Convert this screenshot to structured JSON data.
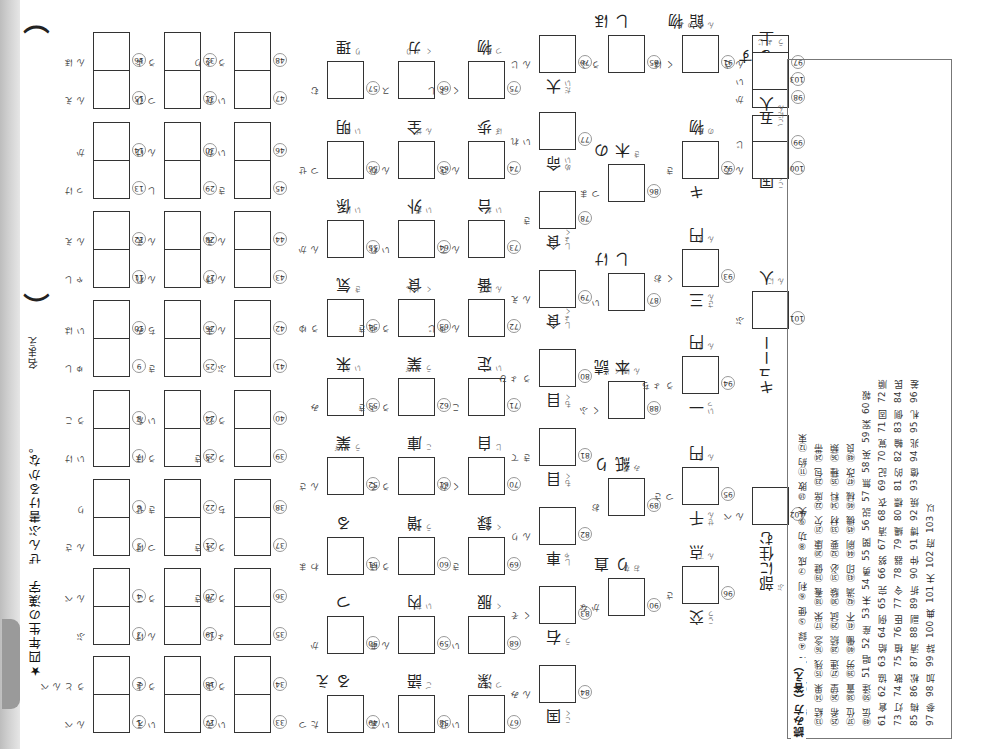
{
  "worksheet": {
    "title": "★四年生の漢字　ぜんぶ書けるかな。",
    "name_label": "名まえ",
    "name_paren_open": "（",
    "name_paren_close": "）",
    "orientation": "rotated 180°"
  },
  "pair_questions": [
    {
      "n": "1",
      "furi": "べん"
    },
    {
      "n": "2",
      "furi": "べんとう"
    },
    {
      "n": "3",
      "furi": "ぶ"
    },
    {
      "n": "4",
      "furi": "べん"
    },
    {
      "n": "5",
      "furi": "さん"
    },
    {
      "n": "6",
      "furi": "り"
    },
    {
      "n": "7",
      "furi": "けい"
    },
    {
      "n": "8",
      "furi": "こう"
    },
    {
      "n": "9",
      "furi": "しゅ"
    },
    {
      "n": "10",
      "furi": "はい"
    },
    {
      "n": "11",
      "furi": "しゃ"
    },
    {
      "n": "12",
      "furi": "えん"
    },
    {
      "n": "13",
      "furi": "けっ"
    },
    {
      "n": "14",
      "furi": "か"
    },
    {
      "n": "15",
      "furi": "えん"
    },
    {
      "n": "16",
      "furi": "ほん"
    },
    {
      "n": "17",
      "furi": "えい"
    },
    {
      "n": "18",
      "furi": "よう"
    },
    {
      "n": "19",
      "furi": "けん"
    },
    {
      "n": "20",
      "furi": "こう"
    },
    {
      "n": "21",
      "furi": "けつ"
    },
    {
      "n": "22",
      "furi": "せき"
    },
    {
      "n": "23",
      "furi": "ほう"
    },
    {
      "n": "24",
      "furi": "たい"
    },
    {
      "n": "25",
      "furi": "き"
    },
    {
      "n": "26",
      "furi": "みち"
    },
    {
      "n": "27",
      "furi": "れん"
    },
    {
      "n": "28",
      "furi": "えん"
    },
    {
      "n": "29",
      "furi": "し"
    },
    {
      "n": "30",
      "furi": "けん"
    },
    {
      "n": "31",
      "furi": "ひつ"
    },
    {
      "n": "32",
      "furi": "よう"
    },
    {
      "n": "33",
      "furi": "えい"
    },
    {
      "n": "34",
      "furi": "よう"
    },
    {
      "n": "35",
      "furi": "しょ"
    },
    {
      "n": "36",
      "furi": "きゅう"
    },
    {
      "n": "37",
      "furi": "きょう"
    },
    {
      "n": "38",
      "furi": "ち"
    },
    {
      "n": "39",
      "furi": "きょう"
    },
    {
      "n": "40",
      "furi": "どう"
    },
    {
      "n": "41",
      "furi": "ぶ"
    },
    {
      "n": "42",
      "furi": "まん"
    },
    {
      "n": "43",
      "furi": "けん"
    },
    {
      "n": "44",
      "furi": "えん"
    },
    {
      "n": "45",
      "furi": "き"
    },
    {
      "n": "46",
      "furi": "かい"
    },
    {
      "n": "47",
      "furi": "かい"
    },
    {
      "n": "48",
      "furi": "りょう"
    }
  ],
  "single_questions": [
    {
      "n": "49",
      "furi": "つた",
      "oku": "える",
      "kanji_hint": "伝"
    },
    {
      "n": "50",
      "furi": "か",
      "oku": "つ",
      "kanji_hint": ""
    },
    {
      "n": "51",
      "furi": "まわ",
      "oku": "る",
      "kanji_hint": ""
    },
    {
      "n": "52",
      "furi": "さん",
      "oku": "業",
      "ofuri": "ぎょう"
    },
    {
      "n": "53",
      "furi": "み",
      "oku": "来",
      "ofuri": "らい"
    },
    {
      "n": "54",
      "furi": "ゆう",
      "oku": "気",
      "ofuri": "き"
    },
    {
      "n": "55",
      "furi": "かん",
      "oku": "係",
      "ofuri": "けい"
    },
    {
      "n": "56",
      "furi": "せつ",
      "oku": "明",
      "ofuri": "めい"
    },
    {
      "n": "57",
      "furi": "む",
      "oku": "理",
      "ofuri": "り"
    },
    {
      "n": "58",
      "furi": "えい",
      "oku": "語",
      "ofuri": "ご"
    },
    {
      "n": "59",
      "furi": "あん",
      "oku": "内",
      "ofuri": "ない"
    },
    {
      "n": "60",
      "furi": "ほう",
      "oku": "増",
      "ofuri": "ぞう"
    },
    {
      "n": "61",
      "furi": "そう",
      "oku": "庫",
      "ofuri": "こ"
    },
    {
      "n": "62",
      "furi": "きょう",
      "oku": "業",
      "ofuri": "ぎょう"
    },
    {
      "n": "63",
      "furi": "きゅう",
      "oku": "食",
      "ofuri": "しょく"
    },
    {
      "n": "64",
      "furi": "れい",
      "oku": "外",
      "ofuri": "がい"
    },
    {
      "n": "65",
      "furi": "かん",
      "oku": "全",
      "ofuri": "ぜん"
    },
    {
      "n": "66",
      "furi": "ス",
      "oku": "カ",
      "ofuri": "りょく"
    },
    {
      "n": "67",
      "furi": "せい",
      "oku": "潔",
      "ofuri": "けつ"
    },
    {
      "n": "68",
      "furi": "い",
      "oku": "服",
      "ofuri": "ふく"
    },
    {
      "n": "69",
      "furi": "き",
      "oku": "録",
      "ofuri": "ろく"
    },
    {
      "n": "70",
      "furi": "かく",
      "oku": "自",
      "ofuri": "じ"
    },
    {
      "n": "71",
      "furi": "こ",
      "oku": "定",
      "ofuri": "てい"
    },
    {
      "n": "72",
      "furi": "じゅん",
      "oku": "番",
      "ofuri": "ばん"
    },
    {
      "n": "73",
      "furi": "てん",
      "oku": "台",
      "ofuri": "だい"
    },
    {
      "n": "74",
      "furi": "さん",
      "oku": "歩",
      "ofuri": "ぽ"
    },
    {
      "n": "75",
      "furi": "しょく",
      "oku": "物",
      "ofuri": "もつ"
    }
  ],
  "column_questions": [
    {
      "n": "76",
      "furi": "じん",
      "pre": "大",
      "prefuri": "だい"
    },
    {
      "n": "77",
      "furi": "れい",
      "pre": "命",
      "prefuri": "めい"
    },
    {
      "n": "78",
      "furi": "き",
      "pre": "食",
      "prefuri": "しょく"
    },
    {
      "n": "79",
      "furi": "えん",
      "pre": "食",
      "prefuri": "しょく"
    },
    {
      "n": "80",
      "furi": "ひょう",
      "pre": "目",
      "prefuri": "もく"
    },
    {
      "n": "81",
      "furi": "てき",
      "pre": "目",
      "prefuri": "もく"
    },
    {
      "n": "82",
      "furi": "りん",
      "pre": "車",
      "prefuri": "しゃ"
    },
    {
      "n": "83",
      "furi": "そく",
      "pre": "右",
      "prefuri": "う"
    },
    {
      "n": "84",
      "furi": "みん",
      "pre": "国",
      "prefuri": "こく"
    },
    {
      "n": "85",
      "furi": "ふう",
      "post": "ほし",
      "postfuri": ""
    },
    {
      "n": "86",
      "furi": "まつ",
      "post": "の木",
      "postfuri": "き"
    },
    {
      "n": "87",
      "furi": "い",
      "post": "けし",
      "postfuri": ""
    },
    {
      "n": "88",
      "furi": "ふく",
      "post": "読本",
      "postfuri": "どくほん"
    },
    {
      "n": "89",
      "furi": "お",
      "post": "り紙",
      "postfuri": "がみ"
    },
    {
      "n": "90",
      "furi": "なか",
      "post": "直り",
      "postfuri": "なお"
    },
    {
      "n": "91",
      "furi": "はく",
      "post": "物館",
      "postfuri": "ぶつかん"
    },
    {
      "n": "92",
      "furi": "き",
      "post": "物",
      "postfuri": "もの",
      "pre": "キ"
    },
    {
      "n": "93",
      "furi": "おく",
      "post": "円",
      "postfuri": "えん",
      "pre": "三",
      "prefuri": "さん"
    },
    {
      "n": "94",
      "furi": "ちょう",
      "post": "円",
      "postfuri": "えん",
      "pre": "一",
      "prefuri": "いっ"
    },
    {
      "n": "95",
      "furi": "さつ",
      "post": "円",
      "postfuri": "えん",
      "pre": "千",
      "prefuri": "せん"
    },
    {
      "n": "96",
      "furi": "さ",
      "post": "点",
      "postfuri": "てん",
      "pre": "交",
      "prefuri": "こう"
    },
    {
      "n": "97",
      "furi": "さん",
      "pair": true
    },
    {
      "n": "98",
      "furi": "か",
      "post": "する"
    },
    {
      "n": "99",
      "furi": "じ",
      "pair": true,
      "pre": "国語",
      "prefuri": "こくご"
    },
    {
      "n": "100",
      "furi": "てん",
      "pair": true
    },
    {
      "n": "101",
      "furi": "ぶ",
      "pre": "キューー",
      "post": "人",
      "postfuri": "にん"
    },
    {
      "n": "102",
      "furi": "べん",
      "pre": "部に住む",
      "prefuri": "ぶ"
    },
    {
      "n": "103",
      "furi": "い",
      "pre": "五人",
      "prefuri": "ごにん",
      "post": "上",
      "postfuri": "じょう"
    }
  ],
  "answer_key": {
    "title": "読み方（答え）",
    "columns": [
      [
        "①特",
        "②別",
        "③付",
        "④録",
        "⑤便",
        "⑥利",
        "⑦成",
        "⑧功",
        "⑨失",
        "⑩敗",
        "⑪約",
        "⑫束"
      ],
      [
        "⑬結",
        "⑭果",
        "⑮残",
        "⑯念",
        "⑰栄",
        "⑱養",
        "⑲健",
        "⑳康",
        "㉑欠",
        "㉒席",
        "㉓包",
        "㉔帯"
      ],
      [
        "㉕希",
        "㉖望",
        "㉗連",
        "㉘続",
        "㉙試",
        "㉚験",
        "㉛必",
        "㉜要",
        "㉝材",
        "㉞料",
        "㉟種",
        "㊱類"
      ],
      [
        "㊲位",
        "㊳置",
        "㊴労",
        "㊵働",
        "㊶不",
        "㊷満",
        "㊸印",
        "㊹刷",
        "㊺機",
        "㊻械",
        "㊼改",
        "㊽良"
      ],
      [
        "㊾伝",
        "㊿達",
        "51 唱",
        "52 産",
        "53 未",
        "54 勇",
        "55 関",
        "56 説",
        "57 無",
        "58 英",
        "59 案",
        "60 報"
      ],
      [
        "61 倉",
        "62 協",
        "63 給",
        "64 例",
        "65 完",
        "66 努",
        "67 清",
        "68 衣",
        "69 記",
        "70 覚",
        "71 固",
        "72 順"
      ],
      [
        "73 灯",
        "74 散",
        "75 植",
        "76 臣",
        "77 令",
        "78 器",
        "79 縄",
        "80 標",
        "81 的",
        "82 輪",
        "83 側",
        "84 民"
      ],
      [
        "85 梅",
        "86 松",
        "87 清",
        "88 副",
        "89 折",
        "90 仲",
        "91 博",
        "92 焼",
        "93 億",
        "94 兆",
        "95 札",
        "96 差"
      ],
      [
        "97 参",
        "98 加",
        "99 辞",
        "100 典",
        "101 夫",
        "102 府",
        "103 以"
      ]
    ]
  }
}
